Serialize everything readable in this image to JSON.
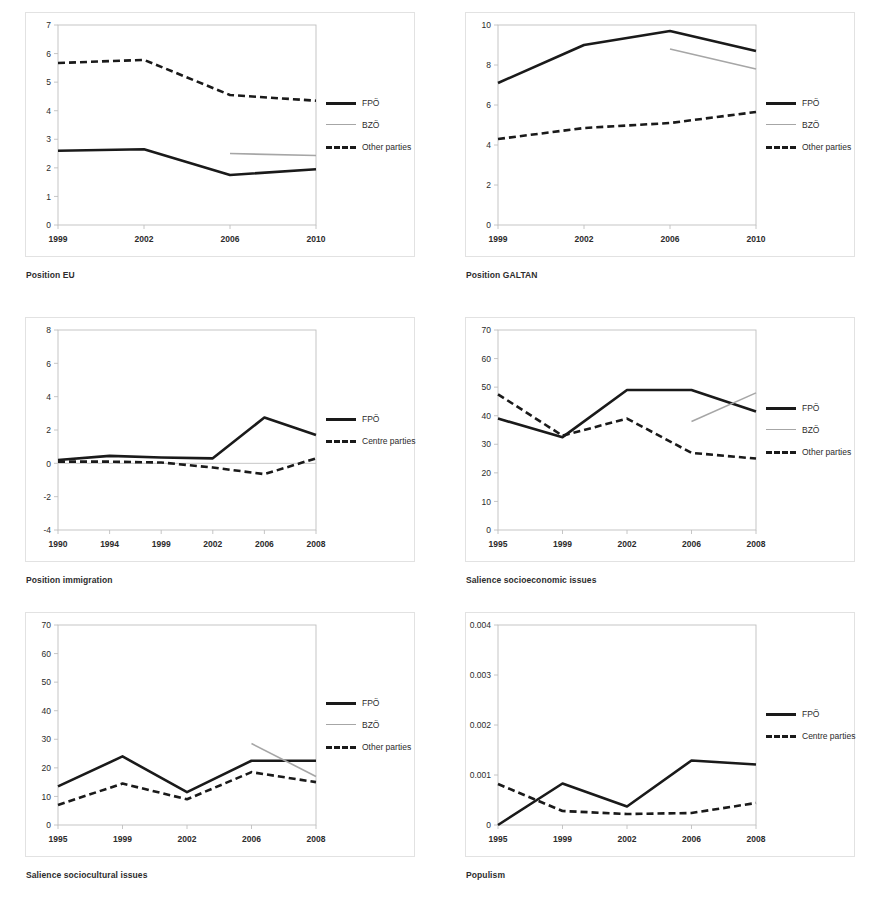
{
  "figure": {
    "panels": [
      {
        "title": "Position EU",
        "legend": [
          {
            "label": "FPÖ",
            "style": "solid-thick"
          },
          {
            "label": "BZÖ",
            "style": "solid-thin"
          },
          {
            "label": "Other parties",
            "style": "dashed"
          }
        ]
      },
      {
        "title": "Position GALTAN",
        "legend": [
          {
            "label": "FPÖ",
            "style": "solid-thick"
          },
          {
            "label": "BZÖ",
            "style": "solid-thin"
          },
          {
            "label": "Other parties",
            "style": "dashed"
          }
        ]
      },
      {
        "title": "Position immigration",
        "legend": [
          {
            "label": "FPÖ",
            "style": "solid-thick"
          },
          {
            "label": "Centre parties",
            "style": "dashed"
          }
        ]
      },
      {
        "title": "Salience socioeconomic issues",
        "legend": [
          {
            "label": "FPÖ",
            "style": "solid-thick"
          },
          {
            "label": "BZÖ",
            "style": "solid-thin"
          },
          {
            "label": "Other parties",
            "style": "dashed"
          }
        ]
      },
      {
        "title": "Salience sociocultural issues",
        "legend": [
          {
            "label": "FPÖ",
            "style": "solid-thick"
          },
          {
            "label": "BZÖ",
            "style": "solid-thin"
          },
          {
            "label": "Other parties",
            "style": "dashed"
          }
        ]
      },
      {
        "title": "Populism",
        "legend": [
          {
            "label": "FPÖ",
            "style": "solid-thick"
          },
          {
            "label": "Centre parties",
            "style": "dashed"
          }
        ]
      }
    ],
    "colors": {
      "fpo": "#1a1a1a",
      "bzo": "#a6a6a6",
      "other": "#1a1a1a",
      "axis": "#bfbfbf",
      "text": "#2b2b2b"
    }
  },
  "chart_data": [
    {
      "type": "line",
      "title": "Position EU",
      "xlabel": "",
      "ylabel": "",
      "categories": [
        "1999",
        "2002",
        "2006",
        "2010"
      ],
      "yticks": [
        0,
        1,
        2,
        3,
        4,
        5,
        6,
        7
      ],
      "ylim": [
        0,
        7
      ],
      "grid": false,
      "legend_position": "right",
      "series": [
        {
          "name": "FPÖ",
          "style": "solid-thick",
          "values": [
            2.6,
            2.65,
            1.75,
            1.95
          ]
        },
        {
          "name": "BZÖ",
          "style": "solid-thin",
          "values": [
            null,
            null,
            2.5,
            2.43
          ]
        },
        {
          "name": "Other parties",
          "style": "dashed",
          "values": [
            5.67,
            5.78,
            4.55,
            4.35
          ]
        }
      ]
    },
    {
      "type": "line",
      "title": "Position GALTAN",
      "xlabel": "",
      "ylabel": "",
      "categories": [
        "1999",
        "2002",
        "2006",
        "2010"
      ],
      "yticks": [
        0,
        2,
        4,
        6,
        8,
        10
      ],
      "ylim": [
        0,
        10
      ],
      "grid": false,
      "legend_position": "right",
      "series": [
        {
          "name": "FPÖ",
          "style": "solid-thick",
          "values": [
            7.1,
            9.0,
            9.7,
            8.7
          ]
        },
        {
          "name": "BZÖ",
          "style": "solid-thin",
          "values": [
            null,
            null,
            8.8,
            7.8
          ]
        },
        {
          "name": "Other parties",
          "style": "dashed",
          "values": [
            4.3,
            4.85,
            5.1,
            5.65
          ]
        }
      ]
    },
    {
      "type": "line",
      "title": "Position immigration",
      "xlabel": "",
      "ylabel": "",
      "categories": [
        "1990",
        "1994",
        "1999",
        "2002",
        "2006",
        "2008"
      ],
      "yticks": [
        -4,
        -2,
        0,
        2,
        4,
        6,
        8
      ],
      "ylim": [
        -4,
        8
      ],
      "grid": false,
      "legend_position": "right",
      "series": [
        {
          "name": "FPÖ",
          "style": "solid-thick",
          "values": [
            0.2,
            0.45,
            0.35,
            0.3,
            2.75,
            1.7
          ]
        },
        {
          "name": "Centre parties",
          "style": "dashed",
          "values": [
            0.1,
            0.1,
            0.05,
            -0.25,
            -0.65,
            0.3
          ]
        }
      ]
    },
    {
      "type": "line",
      "title": "Salience socioeconomic issues",
      "xlabel": "",
      "ylabel": "",
      "categories": [
        "1995",
        "1999",
        "2002",
        "2006",
        "2008"
      ],
      "yticks": [
        0,
        10,
        20,
        30,
        40,
        50,
        60,
        70
      ],
      "ylim": [
        0,
        70
      ],
      "grid": false,
      "legend_position": "right",
      "series": [
        {
          "name": "FPÖ",
          "style": "solid-thick",
          "values": [
            39,
            32.5,
            49,
            49,
            41.5
          ]
        },
        {
          "name": "BZÖ",
          "style": "solid-thin",
          "values": [
            null,
            null,
            null,
            38,
            48
          ]
        },
        {
          "name": "Other parties",
          "style": "dashed",
          "values": [
            47.5,
            33,
            39,
            27,
            25
          ]
        }
      ]
    },
    {
      "type": "line",
      "title": "Salience sociocultural issues",
      "xlabel": "",
      "ylabel": "",
      "categories": [
        "1995",
        "1999",
        "2002",
        "2006",
        "2008"
      ],
      "yticks": [
        0,
        10,
        20,
        30,
        40,
        50,
        60,
        70
      ],
      "ylim": [
        0,
        70
      ],
      "grid": false,
      "legend_position": "right",
      "series": [
        {
          "name": "FPÖ",
          "style": "solid-thick",
          "values": [
            13.5,
            24,
            11.5,
            22.5,
            22.5
          ]
        },
        {
          "name": "BZÖ",
          "style": "solid-thin",
          "values": [
            null,
            null,
            null,
            28.5,
            17
          ]
        },
        {
          "name": "Other parties",
          "style": "dashed",
          "values": [
            7,
            14.5,
            9,
            18.5,
            15
          ]
        }
      ]
    },
    {
      "type": "line",
      "title": "Populism",
      "xlabel": "",
      "ylabel": "",
      "categories": [
        "1995",
        "1999",
        "2002",
        "2006",
        "2008"
      ],
      "yticks": [
        0,
        0.001,
        0.002,
        0.003,
        0.004
      ],
      "ytick_labels": [
        "0",
        "0.001",
        "0.002",
        "0.003",
        "0.004"
      ],
      "ylim": [
        0,
        0.004
      ],
      "grid": false,
      "legend_position": "right",
      "series": [
        {
          "name": "FPÖ",
          "style": "solid-thick",
          "values": [
            0,
            0.00083,
            0.00037,
            0.00129,
            0.00121
          ]
        },
        {
          "name": "Centre parties",
          "style": "dashed",
          "values": [
            0.00082,
            0.00028,
            0.00022,
            0.00024,
            0.00044
          ]
        }
      ]
    }
  ]
}
